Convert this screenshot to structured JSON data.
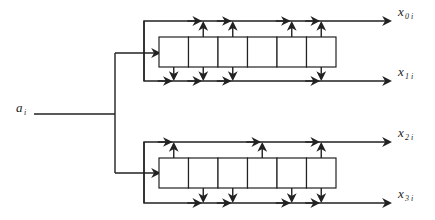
{
  "diagram": {
    "input": {
      "label": "a",
      "subscript": "i"
    },
    "outputs": [
      {
        "label": "x",
        "subscript": "0 i"
      },
      {
        "label": "x",
        "subscript": "1 i"
      },
      {
        "label": "x",
        "subscript": "2 i"
      },
      {
        "label": "x",
        "subscript": "3 i"
      }
    ],
    "registers": [
      {
        "name": "upper-shift-register",
        "cells": 6,
        "taps_up": [
          1,
          2,
          4,
          5
        ],
        "taps_down": [
          0,
          1,
          2,
          5
        ],
        "upper_output": "x_0i",
        "lower_output": "x_1i"
      },
      {
        "name": "lower-shift-register",
        "cells": 6,
        "taps_up": [
          0,
          3,
          5
        ],
        "taps_down": [
          1,
          2,
          4,
          5
        ],
        "upper_output": "x_2i",
        "lower_output": "x_3i"
      }
    ]
  }
}
